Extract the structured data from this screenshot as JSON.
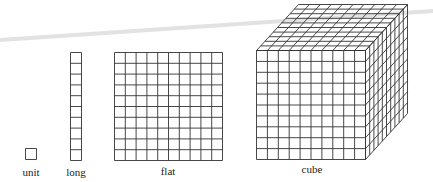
{
  "labels": {
    "unit": "unit",
    "long": "long",
    "flat": "flat",
    "cube": "cube"
  },
  "blocks": [
    {
      "name": "unit",
      "cells": "1x1"
    },
    {
      "name": "long",
      "cells": "1x10"
    },
    {
      "name": "flat",
      "cells": "10x10"
    },
    {
      "name": "cube",
      "cells": "10x10x10"
    }
  ],
  "colors": {
    "line": "#333333",
    "artifact": "#d8d8d8",
    "background": "#ffffff"
  }
}
